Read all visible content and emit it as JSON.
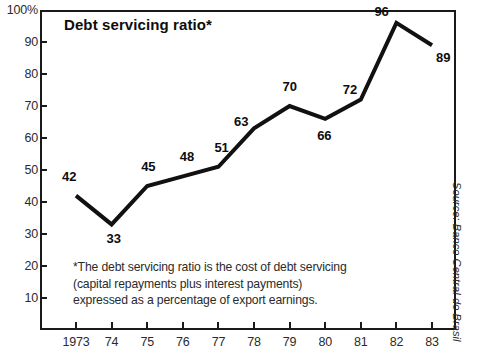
{
  "chart_data": {
    "type": "line",
    "title": "Debt servicing ratio*",
    "xlabel": "",
    "ylabel": "",
    "ylim": [
      0,
      100
    ],
    "xlim": [
      1973,
      1983
    ],
    "grid": false,
    "legend": "none",
    "x": [
      1973,
      1974,
      1975,
      1976,
      1977,
      1978,
      1979,
      1980,
      1981,
      1982,
      1983
    ],
    "categories": [
      "1973",
      "74",
      "75",
      "76",
      "77",
      "78",
      "79",
      "80",
      "81",
      "82",
      "83"
    ],
    "values": [
      42,
      33,
      45,
      48,
      51,
      63,
      70,
      66,
      72,
      96,
      89
    ],
    "series": [
      {
        "name": "Debt servicing ratio",
        "values": [
          42,
          33,
          45,
          48,
          51,
          63,
          70,
          66,
          72,
          96,
          89
        ],
        "color": "#111111"
      }
    ],
    "y_ticks": [
      10,
      20,
      30,
      40,
      50,
      60,
      70,
      80,
      90,
      100
    ],
    "y_tick_labels": [
      "10",
      "20",
      "30",
      "40",
      "50",
      "60",
      "70",
      "80",
      "90",
      "100%"
    ],
    "data_labels": [
      "42",
      "33",
      "45",
      "48",
      "51",
      "63",
      "70",
      "66",
      "72",
      "96",
      "89"
    ],
    "annotations": [
      "*The debt servicing ratio is the cost of debt servicing",
      "(capital repayments plus interest payments)",
      "expressed as a percentage of export earnings."
    ],
    "source": "Source: Banco Central do Brasil"
  },
  "chart": {
    "title": "Debt servicing ratio*",
    "footnote": {
      "line1": "*The debt servicing ratio is the cost of debt servicing",
      "line2": "(capital repayments plus interest payments)",
      "line3": "expressed as a percentage of export earnings."
    },
    "source": "Source: Banco Central do Brasil"
  }
}
